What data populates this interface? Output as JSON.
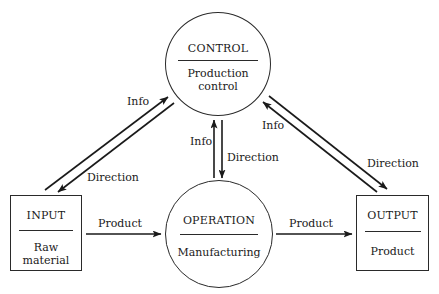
{
  "diagram": {
    "type": "flow-diagram",
    "colors": {
      "stroke": "#1a1a1a",
      "background": "#ffffff"
    },
    "nodes": {
      "control": {
        "shape": "circle",
        "title": "CONTROL",
        "subtitle_line1": "Production",
        "subtitle_line2": "control"
      },
      "input": {
        "shape": "box",
        "title": "INPUT",
        "subtitle_line1": "Raw",
        "subtitle_line2": "material"
      },
      "operation": {
        "shape": "circle",
        "title": "OPERATION",
        "subtitle_line1": "Manufacturing"
      },
      "output": {
        "shape": "box",
        "title": "OUTPUT",
        "subtitle_line1": "Product"
      }
    },
    "edges": {
      "input_to_control": {
        "from": "INPUT",
        "to": "CONTROL",
        "label": "Info"
      },
      "control_to_input": {
        "from": "CONTROL",
        "to": "INPUT",
        "label": "Direction"
      },
      "operation_to_control": {
        "from": "OPERATION",
        "to": "CONTROL",
        "label": "Info"
      },
      "control_to_operation": {
        "from": "CONTROL",
        "to": "OPERATION",
        "label": "Direction"
      },
      "output_to_control": {
        "from": "OUTPUT",
        "to": "CONTROL",
        "label": "Info"
      },
      "control_to_output": {
        "from": "CONTROL",
        "to": "OUTPUT",
        "label": "Direction"
      },
      "input_to_operation": {
        "from": "INPUT",
        "to": "OPERATION",
        "label": "Product"
      },
      "operation_to_output": {
        "from": "OPERATION",
        "to": "OUTPUT",
        "label": "Product"
      }
    }
  }
}
